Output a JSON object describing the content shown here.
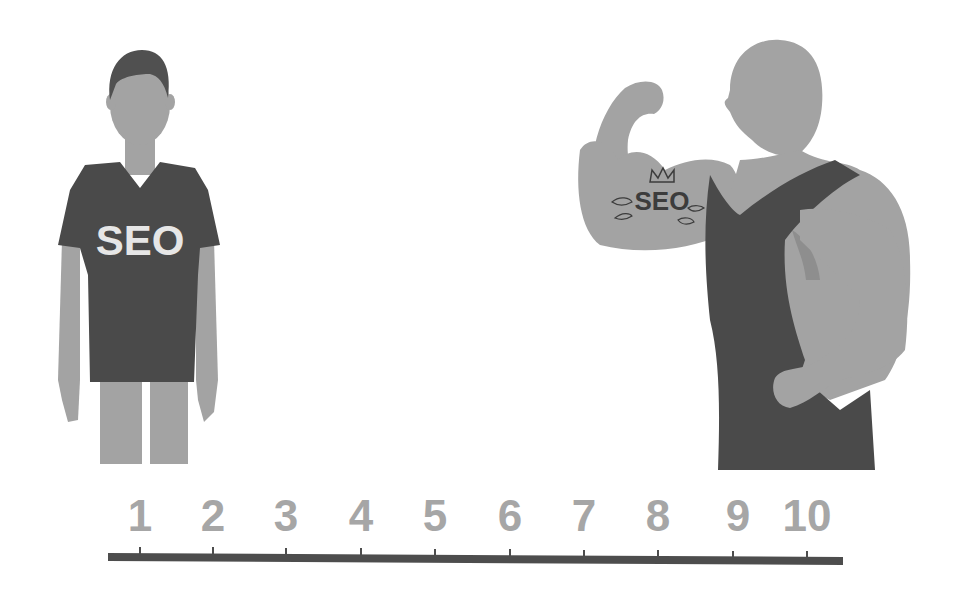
{
  "colors": {
    "background": "#ffffff",
    "skin": "#a3a3a3",
    "skin_shadow": "#8e8e8e",
    "clothing": "#4a4a4a",
    "hair": "#505050",
    "scale_numbers": "#a6a6a6",
    "scale_bar": "#4d4d4d",
    "shirt_text": "#e6e6e6",
    "tattoo_ink": "#3c3c3c"
  },
  "weak_figure": {
    "shirt_text": "SEO"
  },
  "strong_figure": {
    "tattoo_text": "SEO",
    "tattoo_decorations": [
      "crown-icon",
      "leaf-icon",
      "leaf-icon",
      "leaf-icon",
      "leaf-icon"
    ]
  },
  "scale": {
    "labels": [
      "1",
      "2",
      "3",
      "4",
      "5",
      "6",
      "7",
      "8",
      "9",
      "10"
    ],
    "tick_x": [
      140,
      213,
      286,
      361,
      435,
      510,
      584,
      658,
      733,
      807
    ]
  }
}
